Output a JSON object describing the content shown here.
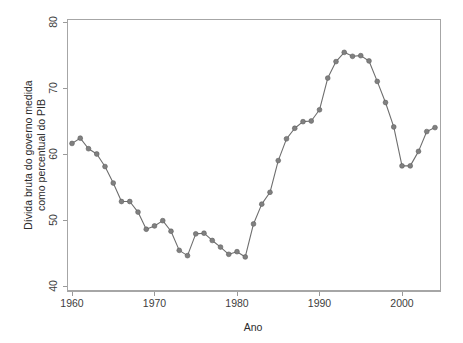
{
  "chart_data": {
    "type": "line",
    "title": "",
    "subtitle": "",
    "xlabel": "Ano",
    "ylabel": "Dívida bruta do governo medida como percentual do PIB",
    "ylabel_lines": [
      "Dívida bruta do governo medida",
      "como percentual do PIB"
    ],
    "xlim": [
      1959,
      2005
    ],
    "ylim": [
      40,
      80
    ],
    "x_ticks": [
      1960,
      1970,
      1980,
      1990,
      2000
    ],
    "x_tick_labels": [
      "1960",
      "1970",
      "1980",
      "1990",
      "2000"
    ],
    "y_ticks": [
      40,
      50,
      60,
      70,
      80
    ],
    "y_tick_labels": [
      "40",
      "50",
      "60",
      "70",
      "80"
    ],
    "grid": false,
    "legend": false,
    "legend_position": "none",
    "marker": "filled-circle",
    "marker_color": "#808080",
    "line_color": "#6e6e6e",
    "frame_color": "#a6a6a6",
    "background_color": "#ffffff",
    "x": [
      1960,
      1961,
      1962,
      1963,
      1964,
      1965,
      1966,
      1967,
      1968,
      1969,
      1970,
      1971,
      1972,
      1973,
      1974,
      1975,
      1976,
      1977,
      1978,
      1979,
      1980,
      1981,
      1982,
      1983,
      1984,
      1985,
      1986,
      1987,
      1988,
      1989,
      1990,
      1991,
      1992,
      1993,
      1994,
      1995,
      1996,
      1997,
      1998,
      1999,
      2000,
      2001,
      2002,
      2003,
      2004
    ],
    "values": [
      61.6,
      62.4,
      60.8,
      60.0,
      58.1,
      55.6,
      52.8,
      52.8,
      51.2,
      48.6,
      49.1,
      49.9,
      48.3,
      45.4,
      44.6,
      47.9,
      48.0,
      46.9,
      45.9,
      44.8,
      45.2,
      44.4,
      49.4,
      52.4,
      54.2,
      59.0,
      62.3,
      63.9,
      64.9,
      65.0,
      66.7,
      71.5,
      74.0,
      75.4,
      74.8,
      74.9,
      74.1,
      71.0,
      67.8,
      64.1,
      58.2,
      58.2,
      60.4,
      63.4,
      64.0
    ],
    "series": [
      {
        "name": "Dívida bruta do governo (% do PIB)",
        "values": [
          61.6,
          62.4,
          60.8,
          60.0,
          58.1,
          55.6,
          52.8,
          52.8,
          51.2,
          48.6,
          49.1,
          49.9,
          48.3,
          45.4,
          44.6,
          47.9,
          48.0,
          46.9,
          45.9,
          44.8,
          45.2,
          44.4,
          49.4,
          52.4,
          54.2,
          59.0,
          62.3,
          63.9,
          64.9,
          65.0,
          66.7,
          71.5,
          74.0,
          75.4,
          74.8,
          74.9,
          74.1,
          71.0,
          67.8,
          64.1,
          58.2,
          58.2,
          60.4,
          63.4,
          64.0
        ]
      }
    ]
  }
}
